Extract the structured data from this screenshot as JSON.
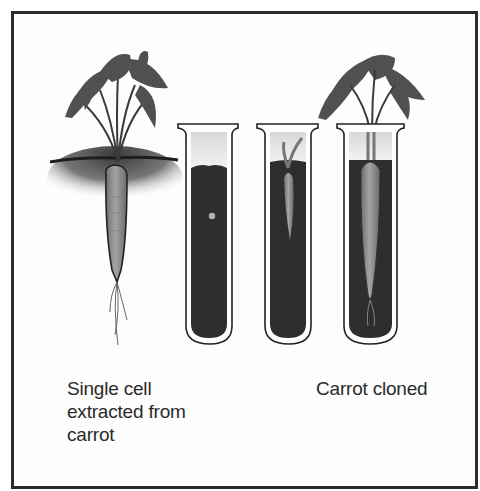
{
  "diagram": {
    "stages": [
      {
        "id": "parent",
        "description": "Mature carrot plant growing in soil"
      },
      {
        "id": "tube-1",
        "description": "Test tube with nutrient medium containing a single cell"
      },
      {
        "id": "tube-2",
        "description": "Test tube with small developing carrot plantlet"
      },
      {
        "id": "tube-3",
        "description": "Test tube with fully grown cloned carrot with leafy top"
      }
    ],
    "labels": {
      "left": [
        "Single cell",
        "extracted from",
        "carrot"
      ],
      "right": [
        "Carrot cloned"
      ]
    },
    "colors": {
      "frame": "#2b2b2b",
      "medium": "#2e2e2e",
      "carrot": "#8a8a8a",
      "foliage": "#4a4a4a",
      "text": "#2a2a2a"
    }
  }
}
